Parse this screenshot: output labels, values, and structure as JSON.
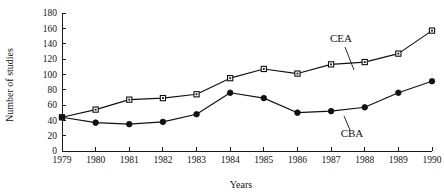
{
  "chart_data": {
    "type": "line",
    "title": "",
    "subtitle": "",
    "xlabel": "Years",
    "ylabel": "Number of studies",
    "x": [
      1979,
      1980,
      1981,
      1982,
      1983,
      1984,
      1985,
      1986,
      1987,
      1988,
      1989,
      1990
    ],
    "categories": [
      "1979",
      "1980",
      "1981",
      "1982",
      "1983",
      "1984",
      "1985",
      "1986",
      "1987",
      "1988",
      "1989",
      "1990"
    ],
    "xlim": [
      1979,
      1990
    ],
    "ylim": [
      0,
      180
    ],
    "yticks": [
      0,
      20,
      40,
      60,
      80,
      100,
      120,
      140,
      160,
      180
    ],
    "ytick_labels": [
      "0",
      "20",
      "40",
      "60",
      "80",
      "100",
      "120",
      "140",
      "160",
      "180"
    ],
    "xtick_labels": [
      "1979",
      "1980",
      "1981",
      "1982",
      "1983",
      "1984",
      "1985",
      "1986",
      "1987",
      "1988",
      "1989",
      "1990"
    ],
    "grid": false,
    "legend_position": "inline-annotation",
    "series": [
      {
        "name": "CEA",
        "marker": "open-square",
        "color": "#111111",
        "values": [
          44,
          54,
          67,
          69,
          74,
          95,
          107,
          101,
          113,
          116,
          127,
          157
        ],
        "annotation": {
          "label": "CEA",
          "x": 341,
          "y": 42,
          "leader_from_x": 345,
          "leader_from_y": 47,
          "leader_to_x": 354,
          "leader_to_y": 70
        }
      },
      {
        "name": "CBA",
        "marker": "filled-circle",
        "color": "#111111",
        "values": [
          44,
          37,
          35,
          38,
          48,
          76,
          69,
          50,
          52,
          57,
          76,
          91
        ],
        "annotation": {
          "label": "CBA",
          "x": 352,
          "y": 137,
          "leader_from_x": 350,
          "leader_from_y": 130,
          "leader_to_x": 344,
          "leader_to_y": 116
        }
      }
    ]
  },
  "axes": {
    "y_axis_title": "Number of studies",
    "x_axis_title": "Years"
  }
}
